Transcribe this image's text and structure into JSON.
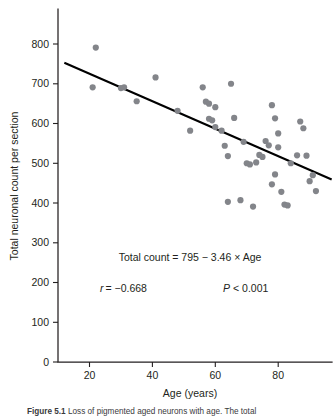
{
  "figure": {
    "caption_label": "Figure 5.1",
    "caption_text": "Loss of pigmented aged neurons with age. The total"
  },
  "chart_data": {
    "type": "scatter",
    "title": "",
    "xlabel": "Age (years)",
    "ylabel": "Total neuronal count per section",
    "xlim": [
      10,
      97
    ],
    "ylim": [
      0,
      850
    ],
    "xticks": [
      20,
      40,
      60,
      80
    ],
    "yticks": [
      0,
      100,
      200,
      300,
      400,
      500,
      600,
      700,
      800
    ],
    "xtick_labels": [
      "20",
      "40",
      "60",
      "80"
    ],
    "ytick_labels": [
      "0",
      "100",
      "200",
      "300",
      "400",
      "500",
      "600",
      "700",
      "800"
    ],
    "grid": false,
    "legend": false,
    "point_color": "#83858a",
    "point_radius": 3.1,
    "line_color": "#000000",
    "series": [
      {
        "name": "Total neuronal count per section",
        "x": [
          22,
          21,
          30,
          31,
          35,
          41,
          48,
          52,
          56,
          57,
          58,
          58,
          59,
          60,
          60,
          62,
          63,
          64,
          64,
          65,
          66,
          68,
          69,
          70,
          71,
          72,
          73,
          74,
          75,
          76,
          77,
          78,
          78,
          79,
          79,
          80,
          80,
          81,
          82,
          83,
          84,
          86,
          87,
          88,
          89,
          90,
          91,
          92
        ],
        "y": [
          791,
          691,
          689,
          691,
          656,
          716,
          632,
          582,
          691,
          655,
          650,
          612,
          608,
          641,
          591,
          582,
          544,
          518,
          403,
          700,
          614,
          407,
          554,
          500,
          497,
          391,
          502,
          521,
          516,
          556,
          545,
          646,
          447,
          613,
          472,
          540,
          575,
          428,
          396,
          394,
          500,
          520,
          605,
          588,
          519,
          455,
          470,
          430
        ]
      }
    ],
    "regression": {
      "equation_label": "Total count = 795 − 3.46 × Age",
      "intercept": 795,
      "slope": -3.46,
      "x_start": 12,
      "x_end": 97,
      "y_start": 753,
      "y_end": 459
    },
    "annotations": {
      "equation": "Total count = 795 − 3.46 × Age",
      "correlation_symbol": "r",
      "correlation_value": "= −0.668",
      "pvalue_symbol": "P",
      "pvalue_value": "< 0.001"
    }
  }
}
